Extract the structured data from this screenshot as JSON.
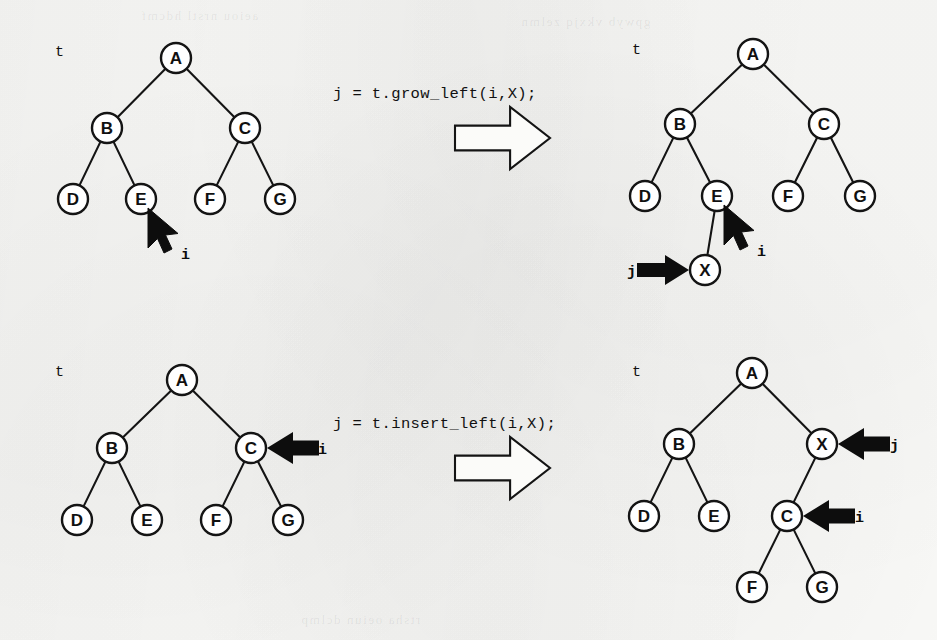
{
  "figure": {
    "kind": "binary-tree-operation-diagram",
    "background_color": "#f8f8f6",
    "ink_color": "#111111",
    "panel_count": 4
  },
  "ghost_bleed_text": [
    "aeiou nrstl hdcmf",
    "gpwyb vkxjq zelmn",
    "rtsha oeiun dclmp"
  ],
  "captions": [
    {
      "id": "caption-grow-left",
      "text": "j = t.grow_left(i,X);",
      "x": 333,
      "y": 85
    },
    {
      "id": "caption-insert-left",
      "text": "j = t.insert_left(i,X);",
      "x": 333,
      "y": 415
    }
  ],
  "block_arrows": [
    {
      "id": "block-arrow-top",
      "x": 455,
      "y": 107,
      "width": 95,
      "height": 62
    },
    {
      "id": "block-arrow-bottom",
      "x": 455,
      "y": 437,
      "width": 95,
      "height": 62
    }
  ],
  "panels": [
    {
      "id": "panel-top-left",
      "title": "before-grow-left",
      "tree_name": "t",
      "tree_name_pos": {
        "x": 55,
        "y": 52
      },
      "node_radius": 15,
      "nodes": [
        {
          "id": "A",
          "label": "A",
          "x": 176,
          "y": 58
        },
        {
          "id": "B",
          "label": "B",
          "x": 107,
          "y": 128
        },
        {
          "id": "C",
          "label": "C",
          "x": 245,
          "y": 128
        },
        {
          "id": "D",
          "label": "D",
          "x": 73,
          "y": 199
        },
        {
          "id": "E",
          "label": "E",
          "x": 141,
          "y": 199
        },
        {
          "id": "F",
          "label": "F",
          "x": 210,
          "y": 199
        },
        {
          "id": "G",
          "label": "G",
          "x": 280,
          "y": 199
        }
      ],
      "edges": [
        {
          "from": "A",
          "to": "B"
        },
        {
          "from": "A",
          "to": "C"
        },
        {
          "from": "B",
          "to": "D"
        },
        {
          "from": "B",
          "to": "E"
        },
        {
          "from": "C",
          "to": "F"
        },
        {
          "from": "C",
          "to": "G"
        }
      ],
      "pointers": [
        {
          "id": "pointer-i-top-left",
          "label": "i",
          "style": "cursor",
          "target_node": "E",
          "tip": {
            "x": 148,
            "y": 208
          },
          "label_pos": {
            "x": 181,
            "y": 255
          }
        }
      ]
    },
    {
      "id": "panel-top-right",
      "title": "after-grow-left",
      "tree_name": "t",
      "tree_name_pos": {
        "x": 632,
        "y": 50
      },
      "node_radius": 15,
      "nodes": [
        {
          "id": "A",
          "label": "A",
          "x": 753,
          "y": 54
        },
        {
          "id": "B",
          "label": "B",
          "x": 680,
          "y": 124
        },
        {
          "id": "C",
          "label": "C",
          "x": 824,
          "y": 124
        },
        {
          "id": "D",
          "label": "D",
          "x": 645,
          "y": 196
        },
        {
          "id": "E",
          "label": "E",
          "x": 717,
          "y": 196
        },
        {
          "id": "F",
          "label": "F",
          "x": 788,
          "y": 196
        },
        {
          "id": "G",
          "label": "G",
          "x": 860,
          "y": 196
        },
        {
          "id": "X",
          "label": "X",
          "x": 705,
          "y": 270
        }
      ],
      "edges": [
        {
          "from": "A",
          "to": "B"
        },
        {
          "from": "A",
          "to": "C"
        },
        {
          "from": "B",
          "to": "D"
        },
        {
          "from": "B",
          "to": "E"
        },
        {
          "from": "C",
          "to": "F"
        },
        {
          "from": "C",
          "to": "G"
        },
        {
          "from": "E",
          "to": "X"
        }
      ],
      "pointers": [
        {
          "id": "pointer-i-top-right",
          "label": "i",
          "style": "cursor",
          "target_node": "E",
          "tip": {
            "x": 724,
            "y": 205
          },
          "label_pos": {
            "x": 757,
            "y": 252
          }
        },
        {
          "id": "pointer-j-top-right",
          "label": "j",
          "style": "solid-right",
          "target_node": "X",
          "tip": {
            "x": 689,
            "y": 270
          },
          "label_pos": {
            "x": 627,
            "y": 272
          }
        }
      ]
    },
    {
      "id": "panel-bottom-left",
      "title": "before-insert-left",
      "tree_name": "t",
      "tree_name_pos": {
        "x": 55,
        "y": 372
      },
      "node_radius": 15,
      "nodes": [
        {
          "id": "A",
          "label": "A",
          "x": 182,
          "y": 380
        },
        {
          "id": "B",
          "label": "B",
          "x": 112,
          "y": 448
        },
        {
          "id": "C",
          "label": "C",
          "x": 251,
          "y": 448
        },
        {
          "id": "D",
          "label": "D",
          "x": 77,
          "y": 520
        },
        {
          "id": "E",
          "label": "E",
          "x": 147,
          "y": 520
        },
        {
          "id": "F",
          "label": "F",
          "x": 216,
          "y": 520
        },
        {
          "id": "G",
          "label": "G",
          "x": 288,
          "y": 520
        }
      ],
      "edges": [
        {
          "from": "A",
          "to": "B"
        },
        {
          "from": "A",
          "to": "C"
        },
        {
          "from": "B",
          "to": "D"
        },
        {
          "from": "B",
          "to": "E"
        },
        {
          "from": "C",
          "to": "F"
        },
        {
          "from": "C",
          "to": "G"
        }
      ],
      "pointers": [
        {
          "id": "pointer-i-bottom-left",
          "label": "i",
          "style": "solid-left",
          "target_node": "C",
          "tip": {
            "x": 267,
            "y": 448
          },
          "label_pos": {
            "x": 318,
            "y": 450
          }
        }
      ]
    },
    {
      "id": "panel-bottom-right",
      "title": "after-insert-left",
      "tree_name": "t",
      "tree_name_pos": {
        "x": 632,
        "y": 372
      },
      "node_radius": 15,
      "nodes": [
        {
          "id": "A",
          "label": "A",
          "x": 752,
          "y": 373
        },
        {
          "id": "B",
          "label": "B",
          "x": 679,
          "y": 444
        },
        {
          "id": "X",
          "label": "X",
          "x": 822,
          "y": 444
        },
        {
          "id": "D",
          "label": "D",
          "x": 644,
          "y": 516
        },
        {
          "id": "E",
          "label": "E",
          "x": 714,
          "y": 516
        },
        {
          "id": "C",
          "label": "C",
          "x": 787,
          "y": 516
        },
        {
          "id": "F",
          "label": "F",
          "x": 752,
          "y": 587
        },
        {
          "id": "G",
          "label": "G",
          "x": 822,
          "y": 587
        }
      ],
      "edges": [
        {
          "from": "A",
          "to": "B"
        },
        {
          "from": "A",
          "to": "X"
        },
        {
          "from": "B",
          "to": "D"
        },
        {
          "from": "B",
          "to": "E"
        },
        {
          "from": "X",
          "to": "C"
        },
        {
          "from": "C",
          "to": "F"
        },
        {
          "from": "C",
          "to": "G"
        }
      ],
      "pointers": [
        {
          "id": "pointer-j-bottom-right",
          "label": "j",
          "style": "solid-left",
          "target_node": "X",
          "tip": {
            "x": 838,
            "y": 444
          },
          "label_pos": {
            "x": 890,
            "y": 446
          }
        },
        {
          "id": "pointer-i-bottom-right",
          "label": "i",
          "style": "solid-left",
          "target_node": "C",
          "tip": {
            "x": 803,
            "y": 516
          },
          "label_pos": {
            "x": 855,
            "y": 518
          }
        }
      ]
    }
  ]
}
